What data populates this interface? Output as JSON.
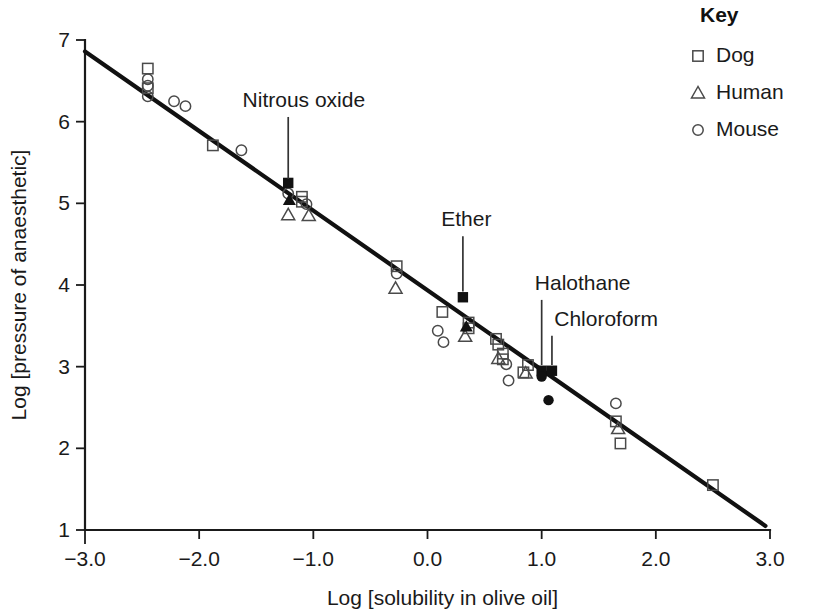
{
  "chart_data": {
    "type": "scatter",
    "title": "",
    "xlabel": "Log [solubility in olive oil]",
    "ylabel": "Log [pressure of anaesthetic]",
    "xlim": [
      -3.0,
      3.0
    ],
    "ylim": [
      1,
      7
    ],
    "xticklabels": [
      "-3.0",
      "-2.0",
      "-1.0",
      "0.0",
      "1.0",
      "2.0",
      "3.0"
    ],
    "xtickvalues": [
      -3.0,
      -2.0,
      -1.0,
      0.0,
      1.0,
      2.0,
      3.0
    ],
    "yticklabels": [
      "1",
      "2",
      "3",
      "4",
      "5",
      "6",
      "7"
    ],
    "ytickvalues": [
      1,
      2,
      3,
      4,
      5,
      6,
      7
    ],
    "grid": false,
    "legend_position": "top-right",
    "legend_title": "Key",
    "legend": [
      {
        "label": "Dog",
        "marker": "square-open"
      },
      {
        "label": "Human",
        "marker": "triangle-open"
      },
      {
        "label": "Mouse",
        "marker": "circle-open"
      }
    ],
    "trendline": {
      "label": "regression line",
      "x0": -3.0,
      "y0": 6.86,
      "x1": 2.96,
      "y1": 1.05,
      "slope": -0.975
    },
    "series": [
      {
        "name": "Dog",
        "marker": "square-open",
        "points": [
          [
            -2.45,
            6.65
          ],
          [
            -2.45,
            6.41
          ],
          [
            -1.88,
            5.71
          ],
          [
            -1.1,
            5.08
          ],
          [
            -1.1,
            5.02
          ],
          [
            -0.27,
            4.23
          ],
          [
            0.13,
            3.67
          ],
          [
            0.36,
            3.54
          ],
          [
            0.36,
            3.47
          ],
          [
            0.6,
            3.34
          ],
          [
            0.62,
            3.27
          ],
          [
            0.66,
            3.16
          ],
          [
            0.66,
            3.09
          ],
          [
            0.88,
            3.02
          ],
          [
            0.84,
            2.93
          ],
          [
            1.65,
            2.33
          ],
          [
            1.69,
            2.06
          ],
          [
            2.5,
            1.55
          ]
        ]
      },
      {
        "name": "Human",
        "marker": "triangle-open",
        "points": [
          [
            -1.22,
            4.86
          ],
          [
            -1.04,
            4.85
          ],
          [
            -0.28,
            3.96
          ],
          [
            0.33,
            3.37
          ],
          [
            0.62,
            3.1
          ],
          [
            0.86,
            2.92
          ],
          [
            1.67,
            2.24
          ]
        ]
      },
      {
        "name": "Mouse",
        "marker": "circle-open",
        "points": [
          [
            -2.45,
            6.52
          ],
          [
            -2.45,
            6.44
          ],
          [
            -2.45,
            6.31
          ],
          [
            -2.22,
            6.25
          ],
          [
            -2.12,
            6.19
          ],
          [
            -1.63,
            5.65
          ],
          [
            -1.22,
            5.12
          ],
          [
            -1.06,
            4.99
          ],
          [
            -0.27,
            4.14
          ],
          [
            0.09,
            3.44
          ],
          [
            0.14,
            3.3
          ],
          [
            0.69,
            3.03
          ],
          [
            0.71,
            2.83
          ],
          [
            1.65,
            2.55
          ]
        ]
      },
      {
        "name": "Highlighted anaesthetics",
        "marker": "square-filled",
        "points": [
          [
            -1.22,
            5.25
          ],
          [
            0.31,
            3.85
          ],
          [
            1.0,
            2.95
          ],
          [
            1.09,
            2.95
          ]
        ]
      },
      {
        "name": "Highlighted anaesthetics (human)",
        "marker": "triangle-filled",
        "points": [
          [
            -1.21,
            5.04
          ],
          [
            0.34,
            3.49
          ]
        ]
      },
      {
        "name": "Highlighted anaesthetics (mouse)",
        "marker": "circle-filled",
        "points": [
          [
            1.0,
            2.88
          ],
          [
            1.06,
            2.59
          ]
        ]
      }
    ],
    "annotations": [
      {
        "text": "Nitrous oxide",
        "point": [
          -1.22,
          5.3
        ],
        "label_x": -1.62,
        "label_y": 6.18
      },
      {
        "text": "Ether",
        "point": [
          0.31,
          3.92
        ],
        "label_x": 0.12,
        "label_y": 4.72
      },
      {
        "text": "Halothane",
        "point": [
          1.0,
          3.02
        ],
        "label_x": 0.94,
        "label_y": 3.94
      },
      {
        "text": "Chloroform",
        "point": [
          1.09,
          3.02
        ],
        "label_x": 1.11,
        "label_y": 3.5
      }
    ]
  }
}
